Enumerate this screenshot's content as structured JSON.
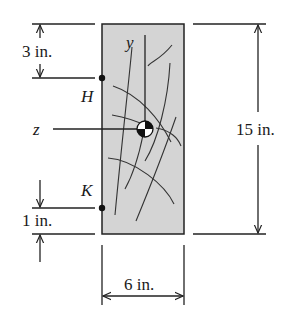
{
  "diagram": {
    "type": "beam-cross-section",
    "material": "wood",
    "fill_color": "#d4d4d4",
    "stroke_color": "#222222",
    "axes": {
      "y_label": "y",
      "z_label": "z"
    },
    "points": {
      "H": {
        "label": "H"
      },
      "K": {
        "label": "K"
      }
    },
    "dimensions": {
      "top_to_H": "3 in.",
      "K_to_bottom": "1 in.",
      "height": "15 in.",
      "width": "6 in."
    },
    "centroid_symbol": "centroid-icon"
  }
}
